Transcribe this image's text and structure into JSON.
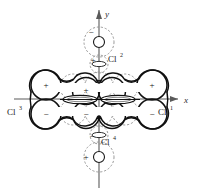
{
  "figure": {
    "background_color": "#ffffff",
    "ink_color": "#1a1a1a",
    "dashed_color": "#8a8a8a",
    "axis_color": "#5a5a5a"
  },
  "axes": {
    "x_label": "x",
    "y_label": "y",
    "origin": {
      "x": 99,
      "y": 99
    }
  },
  "ligands": [
    {
      "id": "cl1",
      "label": "Cl",
      "superscript": "1",
      "position": "right",
      "x": 160,
      "y": 112
    },
    {
      "id": "cl2",
      "label": "Cl",
      "superscript": "2",
      "position": "top",
      "x": 112,
      "y": 58
    },
    {
      "id": "cl3",
      "label": "Cl",
      "superscript": "3",
      "position": "left",
      "x": 12,
      "y": 112
    },
    {
      "id": "cl4",
      "label": "Cl",
      "superscript": "4",
      "position": "bottom",
      "x": 103,
      "y": 152
    }
  ],
  "lobe_signs": [
    {
      "id": "lobe-upper-left",
      "sign": "+",
      "x": 46,
      "y": 85
    },
    {
      "id": "lobe-upper-right",
      "sign": "+",
      "x": 152,
      "y": 85
    },
    {
      "id": "lobe-lower-left",
      "sign": "−",
      "x": 46,
      "y": 114
    },
    {
      "id": "lobe-lower-right",
      "sign": "−",
      "x": 152,
      "y": 114
    },
    {
      "id": "lobe-center-upper",
      "sign": "+",
      "x": 86,
      "y": 91
    },
    {
      "id": "lobe-center-lower",
      "sign": "−",
      "x": 86,
      "y": 115
    },
    {
      "id": "ligand-top-upper",
      "sign": "−",
      "x": 88,
      "y": 39
    },
    {
      "id": "ligand-top-lower",
      "sign": "+",
      "x": 92,
      "y": 62
    },
    {
      "id": "ligand-bot-upper",
      "sign": "−",
      "x": 90,
      "y": 137
    },
    {
      "id": "ligand-bot-lower",
      "sign": "+",
      "x": 83,
      "y": 160
    }
  ],
  "geometry": {
    "outer_lobe_radius": 15,
    "center_lobe_radius": 13,
    "dashed_circle_radius": 14,
    "small_ligand_circle_radius": 5.5,
    "ellipse_rx": 17,
    "ellipse_ry": 4
  }
}
